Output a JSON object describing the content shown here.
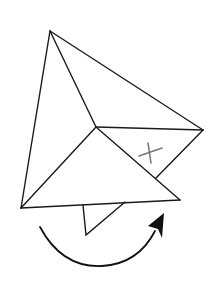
{
  "diagram": {
    "colors": {
      "background": "#ffffff",
      "edge": "#1a1a1a",
      "mark": "#7a7a7a",
      "arrow": "#111111"
    },
    "vertices": {
      "apex": [
        50,
        31
      ],
      "center": [
        96,
        127
      ],
      "right": [
        203,
        130
      ],
      "bottom_left": [
        21,
        208
      ],
      "bottom_right": [
        180,
        200
      ],
      "fold_intersection": [
        156,
        178
      ]
    },
    "small_flap": {
      "points": [
        [
          83,
          205
        ],
        [
          86,
          235
        ],
        [
          125,
          202
        ]
      ]
    },
    "x_mark": {
      "label": "X",
      "stroke1": [
        [
          139,
          156
        ],
        [
          162,
          148
        ]
      ],
      "stroke2": [
        [
          148,
          143
        ],
        [
          151,
          163
        ]
      ]
    },
    "rotation_arrow": {
      "direction": "clockwise",
      "start": [
        40,
        227
      ],
      "bottom": [
        100,
        266
      ],
      "end": [
        155,
        231
      ],
      "tip": [
        164,
        214
      ]
    }
  }
}
